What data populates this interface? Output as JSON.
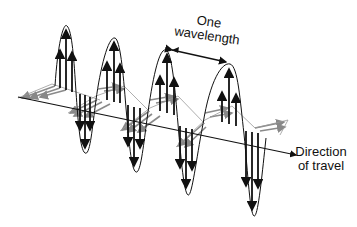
{
  "diagram": {
    "labels": {
      "wavelength_line1": "One",
      "wavelength_line2": "wavelength",
      "direction_line1": "Direction",
      "direction_line2": "of travel"
    },
    "colors": {
      "electric_field": "#111111",
      "magnetic_field": "#8a8a8a",
      "background": "#ffffff"
    }
  }
}
